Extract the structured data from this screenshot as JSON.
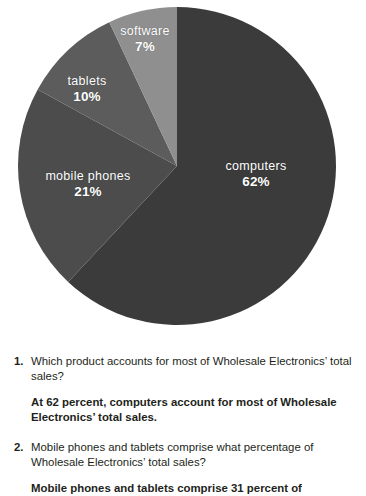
{
  "chart_data": {
    "type": "pie",
    "title": "",
    "subtitle": "",
    "xlabel": "",
    "ylabel": "",
    "legend_position": "none",
    "grid": false,
    "labels_on_slices": true,
    "unit": "%",
    "categories": [
      "computers",
      "mobile phones",
      "tablets",
      "software"
    ],
    "values": [
      62,
      21,
      10,
      7
    ],
    "slices": [
      {
        "label": "computers",
        "value": 62,
        "value_text": "62%",
        "color": "#3b3b3b",
        "start_angle_deg": 0,
        "end_angle_deg": 223.2
      },
      {
        "label": "mobile phones",
        "value": 21,
        "value_text": "21%",
        "color": "#4c4c4c",
        "start_angle_deg": 223.2,
        "end_angle_deg": 298.8
      },
      {
        "label": "tablets",
        "value": 10,
        "value_text": "10%",
        "color": "#5c5c5c",
        "start_angle_deg": 298.8,
        "end_angle_deg": 334.8
      },
      {
        "label": "software",
        "value": 7,
        "value_text": "7%",
        "color": "#8f8f8f",
        "start_angle_deg": 334.8,
        "end_angle_deg": 360
      }
    ]
  },
  "chart": {
    "center_x": 177,
    "center_y": 166,
    "radius": 159,
    "label_color": "#ffffff",
    "background": "#ffffff"
  },
  "qa": {
    "items": [
      {
        "number": "1.",
        "question": "Which product accounts for most of Wholesale Electronics’ total sales?",
        "answer": "At 62 percent, computers account for most of Wholesale Electronics’ total sales."
      },
      {
        "number": "2.",
        "question": "Mobile phones and tablets comprise what percentage of Wholesale Electronics’ total sales?",
        "answer": "Mobile phones and tablets comprise 31 percent of"
      }
    ]
  }
}
